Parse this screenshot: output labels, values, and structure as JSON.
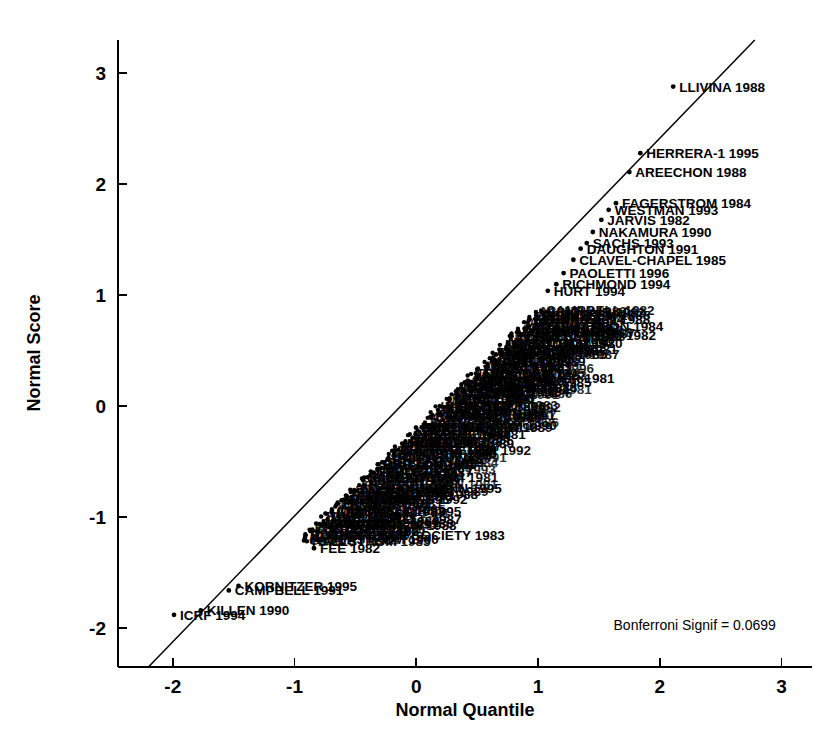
{
  "chart_data": {
    "type": "scatter",
    "title": "",
    "xlabel": "Normal Quantile",
    "ylabel": "Normal Score",
    "xlim": [
      -2.45,
      3.25
    ],
    "ylim": [
      -2.35,
      3.3
    ],
    "xticks": [
      "-2",
      "-1",
      "0",
      "1",
      "2",
      "3"
    ],
    "xtickvals": [
      -2,
      -1,
      0,
      1,
      2,
      3
    ],
    "yticks": [
      "3",
      "2",
      "1",
      "0",
      "-1",
      "-2"
    ],
    "ytickvals": [
      3,
      2,
      1,
      0,
      -1,
      -2
    ],
    "grid": false,
    "legend": null,
    "reference_line": {
      "label": "normal reference line",
      "x1": -2.2,
      "y1": -2.35,
      "x2": 2.78,
      "y2": 3.3
    },
    "annotations": [
      {
        "name": "bonferroni-signif",
        "text": "Bonferroni Signif = 0.0699",
        "x": 1.62,
        "y": -2.02
      }
    ],
    "points": [
      {
        "label": "LLIVINA 1988",
        "x": 2.11,
        "y": 2.88
      },
      {
        "label": "HERRERA-1 1995",
        "x": 1.84,
        "y": 2.28
      },
      {
        "label": "AREECHON 1988",
        "x": 1.75,
        "y": 2.11
      },
      {
        "label": "FAGERSTROM 1984",
        "x": 1.64,
        "y": 1.83
      },
      {
        "label": "WESTMAN 1993",
        "x": 1.58,
        "y": 1.77
      },
      {
        "label": "JARVIS 1982",
        "x": 1.52,
        "y": 1.68
      },
      {
        "label": "NAKAMURA 1990",
        "x": 1.45,
        "y": 1.57
      },
      {
        "label": "SACHS 1993",
        "x": 1.4,
        "y": 1.47
      },
      {
        "label": "DAUGHTON 1991",
        "x": 1.35,
        "y": 1.42
      },
      {
        "label": "CLAVEL-CHAPEL 1985",
        "x": 1.29,
        "y": 1.32
      },
      {
        "label": "PAOLETTI 1996",
        "x": 1.21,
        "y": 1.2
      },
      {
        "label": "RICHMOND 1994",
        "x": 1.15,
        "y": 1.1
      },
      {
        "label": "HURT 1994",
        "x": 1.08,
        "y": 1.04
      },
      {
        "label": "TONNESEN 1988",
        "x": 0.98,
        "y": 0.79
      },
      {
        "label": "HJALMARSON 1984",
        "x": 0.92,
        "y": 0.72
      },
      {
        "label": "FAGERSTROM 1982",
        "x": 0.86,
        "y": 0.64
      },
      {
        "label": "MALCOLM 1980",
        "x": 0.8,
        "y": 0.57
      },
      {
        "label": "NIAURA 1994",
        "x": 0.74,
        "y": 0.52
      },
      {
        "label": "BLONDAL 1985",
        "x": 0.7,
        "y": 0.47
      },
      {
        "label": "ABELIN 1989",
        "x": 0.65,
        "y": 0.41
      },
      {
        "label": "MORI 1992",
        "x": 0.58,
        "y": 0.35
      },
      {
        "label": "BUCHKREMER 1981",
        "x": 0.5,
        "y": 0.25
      },
      {
        "label": "SCHNEIDER 1985",
        "x": 0.46,
        "y": 0.22
      },
      {
        "label": "ZELMAN 1992",
        "x": 0.38,
        "y": 0.13
      },
      {
        "label": "HURT 1990",
        "x": 0.33,
        "y": 0.07
      },
      {
        "label": "GARVEY 1996",
        "x": 0.27,
        "y": 0.0
      },
      {
        "label": "TONNESEN 1991",
        "x": 0.2,
        "y": -0.08
      },
      {
        "label": "HALLSTROM 1990",
        "x": 0.13,
        "y": -0.17
      },
      {
        "label": "JAGUE 1984",
        "x": 0.07,
        "y": -0.25
      },
      {
        "label": "GILBERT 1989",
        "x": -0.01,
        "y": -0.33
      },
      {
        "label": "FORTMANN 1995",
        "x": -0.26,
        "y": -0.74
      },
      {
        "label": "BRITTON 1988",
        "x": -0.31,
        "y": -0.79
      },
      {
        "label": "HUGHES 1992",
        "x": -0.38,
        "y": -0.84
      },
      {
        "label": "SINCLAIR 1995",
        "x": -0.48,
        "y": -0.94
      },
      {
        "label": "CAMPBELL 1987",
        "x": -0.57,
        "y": -1.02
      },
      {
        "label": "AREECHON 1988b",
        "x": -0.63,
        "y": -1.07
      },
      {
        "label": "BRIT THOR SOCIETY 1983",
        "x": -0.72,
        "y": -1.16
      },
      {
        "label": "FEE 1982",
        "x": -0.84,
        "y": -1.28
      },
      {
        "label": "KORNITZER 1995",
        "x": -1.46,
        "y": -1.62
      },
      {
        "label": "CAMPBELL 1991",
        "x": -1.54,
        "y": -1.66
      },
      {
        "label": "KILLEN 1990",
        "x": -1.77,
        "y": -1.84
      },
      {
        "label": "ICRF 1994",
        "x": -1.99,
        "y": -1.88
      }
    ],
    "cluster_note": "dense overlapping label cluster between x=-0.9 and x=1.0"
  },
  "axes": {
    "x_title": "Normal Quantile",
    "y_title": "Normal Score"
  }
}
